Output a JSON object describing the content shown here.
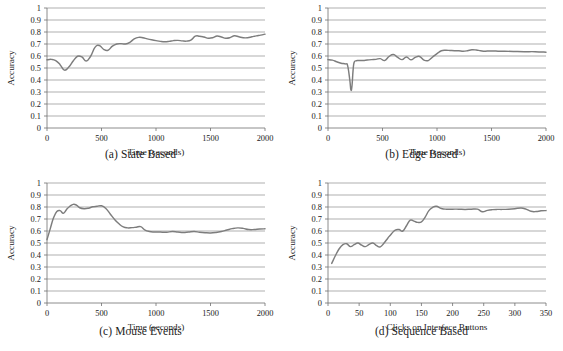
{
  "figure": {
    "name": "accuracy-over-time-four-panel-figure",
    "background": "#ffffff",
    "line_color": "#7d7d7d",
    "grid_color": "#8d8d8d"
  },
  "panels": {
    "a": {
      "caption": "(a) State Based",
      "xlabel": "Time (seconds)",
      "ylabel": "Accuracy"
    },
    "b": {
      "caption": "(b) Edge Based",
      "xlabel": "Time (seconds)",
      "ylabel": "Accuracy"
    },
    "c": {
      "caption": "(c) Mouse Events",
      "xlabel": "Time (seconds)",
      "ylabel": "Accuracy"
    },
    "d": {
      "caption": "(d) Sequence Based",
      "xlabel": "Clicks on Interface Buttons",
      "ylabel": "Accuracy"
    }
  },
  "chart_data": [
    {
      "id": "a",
      "type": "line",
      "title": "(a) State Based",
      "xlabel": "Time (seconds)",
      "ylabel": "Accuracy",
      "xlim": [
        0,
        2000
      ],
      "ylim": [
        0,
        1
      ],
      "xticks": [
        0,
        500,
        1000,
        1500,
        2000
      ],
      "yticks": [
        0,
        0.1,
        0.2,
        0.3,
        0.4,
        0.5,
        0.6,
        0.7,
        0.8,
        0.9,
        1
      ],
      "xticklabels": [
        "0",
        "500",
        "1000",
        "1500",
        "2000"
      ],
      "yticklabels": [
        "0",
        "0.1",
        "0.2",
        "0.3",
        "0.4",
        "0.5",
        "0.6",
        "0.7",
        "0.8",
        "0.9",
        "1"
      ],
      "grid": "horizontal",
      "legend": "none",
      "x": [
        0,
        40,
        80,
        120,
        160,
        200,
        240,
        280,
        320,
        360,
        400,
        440,
        480,
        520,
        560,
        600,
        640,
        680,
        720,
        760,
        800,
        840,
        880,
        920,
        960,
        1000,
        1040,
        1080,
        1120,
        1160,
        1200,
        1240,
        1280,
        1320,
        1360,
        1400,
        1440,
        1480,
        1520,
        1560,
        1600,
        1640,
        1680,
        1720,
        1760,
        1800,
        1840,
        1880,
        1920,
        1960,
        2000
      ],
      "y": [
        0.568,
        0.572,
        0.562,
        0.528,
        0.482,
        0.508,
        0.558,
        0.598,
        0.592,
        0.558,
        0.598,
        0.672,
        0.688,
        0.655,
        0.648,
        0.682,
        0.7,
        0.703,
        0.7,
        0.714,
        0.742,
        0.755,
        0.752,
        0.743,
        0.735,
        0.728,
        0.722,
        0.719,
        0.722,
        0.728,
        0.73,
        0.726,
        0.724,
        0.732,
        0.765,
        0.765,
        0.758,
        0.748,
        0.752,
        0.766,
        0.758,
        0.748,
        0.753,
        0.768,
        0.76,
        0.752,
        0.752,
        0.76,
        0.768,
        0.774,
        0.782
      ]
    },
    {
      "id": "b",
      "type": "line",
      "title": "(b) Edge Based",
      "xlabel": "Time (seconds)",
      "ylabel": "Accuracy",
      "xlim": [
        0,
        2000
      ],
      "ylim": [
        0,
        1
      ],
      "xticks": [
        0,
        500,
        1000,
        1500,
        2000
      ],
      "yticks": [
        0,
        0.1,
        0.2,
        0.3,
        0.4,
        0.5,
        0.6,
        0.7,
        0.8,
        0.9,
        1
      ],
      "xticklabels": [
        "0",
        "500",
        "1000",
        "1500",
        "2000"
      ],
      "yticklabels": [
        "0",
        "0.1",
        "0.2",
        "0.3",
        "0.4",
        "0.5",
        "0.6",
        "0.7",
        "0.8",
        "0.9",
        "1"
      ],
      "grid": "horizontal",
      "legend": "none",
      "x": [
        0,
        40,
        80,
        120,
        160,
        180,
        200,
        210,
        220,
        230,
        240,
        260,
        280,
        320,
        360,
        400,
        440,
        480,
        520,
        560,
        600,
        640,
        680,
        720,
        760,
        800,
        840,
        880,
        920,
        960,
        1000,
        1040,
        1080,
        1120,
        1160,
        1200,
        1240,
        1280,
        1320,
        1360,
        1400,
        1440,
        1480,
        1520,
        1560,
        1600,
        1700,
        1800,
        1900,
        2000
      ],
      "y": [
        0.57,
        0.566,
        0.552,
        0.54,
        0.534,
        0.52,
        0.4,
        0.318,
        0.35,
        0.48,
        0.548,
        0.56,
        0.562,
        0.562,
        0.566,
        0.57,
        0.572,
        0.578,
        0.562,
        0.596,
        0.612,
        0.588,
        0.57,
        0.592,
        0.568,
        0.588,
        0.596,
        0.566,
        0.562,
        0.592,
        0.62,
        0.644,
        0.648,
        0.646,
        0.644,
        0.644,
        0.64,
        0.644,
        0.652,
        0.65,
        0.644,
        0.64,
        0.642,
        0.642,
        0.64,
        0.64,
        0.638,
        0.636,
        0.636,
        0.632
      ]
    },
    {
      "id": "c",
      "type": "line",
      "title": "(c) Mouse Events",
      "xlabel": "Time (seconds)",
      "ylabel": "Accuracy",
      "xlim": [
        0,
        2000
      ],
      "ylim": [
        0,
        1
      ],
      "xticks": [
        0,
        500,
        1000,
        1500,
        2000
      ],
      "yticks": [
        0,
        0.1,
        0.2,
        0.3,
        0.4,
        0.5,
        0.6,
        0.7,
        0.8,
        0.9,
        1
      ],
      "xticklabels": [
        "0",
        "500",
        "1000",
        "1500",
        "2000"
      ],
      "yticklabels": [
        "0",
        "0.1",
        "0.2",
        "0.3",
        "0.4",
        "0.5",
        "0.6",
        "0.7",
        "0.8",
        "0.9",
        "1"
      ],
      "grid": "horizontal",
      "legend": "none",
      "x": [
        0,
        30,
        60,
        90,
        120,
        150,
        180,
        210,
        240,
        270,
        300,
        340,
        380,
        420,
        460,
        500,
        540,
        580,
        620,
        660,
        700,
        740,
        780,
        820,
        860,
        900,
        940,
        980,
        1020,
        1060,
        1100,
        1150,
        1200,
        1250,
        1300,
        1350,
        1400,
        1450,
        1500,
        1550,
        1600,
        1650,
        1700,
        1750,
        1800,
        1850,
        1900,
        1950,
        2000
      ],
      "y": [
        0.528,
        0.62,
        0.71,
        0.762,
        0.77,
        0.748,
        0.78,
        0.806,
        0.822,
        0.816,
        0.794,
        0.786,
        0.79,
        0.802,
        0.806,
        0.81,
        0.788,
        0.742,
        0.696,
        0.66,
        0.634,
        0.626,
        0.628,
        0.632,
        0.636,
        0.608,
        0.596,
        0.592,
        0.592,
        0.59,
        0.59,
        0.596,
        0.592,
        0.588,
        0.592,
        0.596,
        0.59,
        0.586,
        0.584,
        0.588,
        0.596,
        0.608,
        0.62,
        0.626,
        0.622,
        0.612,
        0.612,
        0.616,
        0.618
      ]
    },
    {
      "id": "d",
      "type": "line",
      "title": "(d) Sequence Based",
      "xlabel": "Clicks on Interface Buttons",
      "ylabel": "Accuracy",
      "xlim": [
        0,
        350
      ],
      "ylim": [
        0,
        1
      ],
      "xticks": [
        0,
        50,
        100,
        150,
        200,
        250,
        300,
        350
      ],
      "yticks": [
        0,
        0.1,
        0.2,
        0.3,
        0.4,
        0.5,
        0.6,
        0.7,
        0.8,
        0.9,
        1
      ],
      "xticklabels": [
        "0",
        "50",
        "100",
        "150",
        "200",
        "250",
        "300",
        "350"
      ],
      "yticklabels": [
        "0",
        "0.1",
        "0.2",
        "0.3",
        "0.4",
        "0.5",
        "0.6",
        "0.7",
        "0.8",
        "0.9",
        "1"
      ],
      "grid": "horizontal",
      "legend": "none",
      "x": [
        6,
        12,
        18,
        24,
        30,
        36,
        42,
        48,
        54,
        60,
        66,
        72,
        78,
        84,
        90,
        96,
        102,
        108,
        114,
        120,
        126,
        132,
        138,
        144,
        150,
        156,
        162,
        168,
        174,
        182,
        190,
        200,
        210,
        220,
        230,
        240,
        248,
        256,
        264,
        272,
        280,
        290,
        300,
        310,
        318,
        326,
        334,
        342,
        350
      ],
      "y": [
        0.33,
        0.396,
        0.452,
        0.486,
        0.494,
        0.47,
        0.486,
        0.5,
        0.482,
        0.47,
        0.488,
        0.5,
        0.478,
        0.468,
        0.5,
        0.54,
        0.578,
        0.608,
        0.612,
        0.6,
        0.644,
        0.69,
        0.682,
        0.672,
        0.676,
        0.716,
        0.77,
        0.796,
        0.806,
        0.788,
        0.782,
        0.782,
        0.782,
        0.78,
        0.782,
        0.782,
        0.76,
        0.772,
        0.778,
        0.78,
        0.78,
        0.782,
        0.786,
        0.792,
        0.782,
        0.764,
        0.762,
        0.768,
        0.77
      ]
    }
  ]
}
